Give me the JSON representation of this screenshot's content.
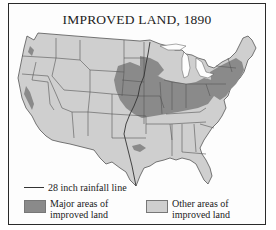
{
  "title": "IMPROVED LAND, 1890",
  "colors": {
    "land_other": "#cfcfcf",
    "land_major": "#8a8a8a",
    "state_border": "#555555",
    "frame": "#2a2a2a",
    "background": "#fdfdfd"
  },
  "legend": {
    "rainfall_line": {
      "label": "28 inch rainfall line",
      "icon": "line-swatch-icon"
    },
    "major": {
      "line1": "Major areas of",
      "line2": "improved land",
      "color": "#8a8a8a"
    },
    "other": {
      "line1": "Other areas of",
      "line2": "improved land",
      "color": "#cfcfcf"
    }
  }
}
